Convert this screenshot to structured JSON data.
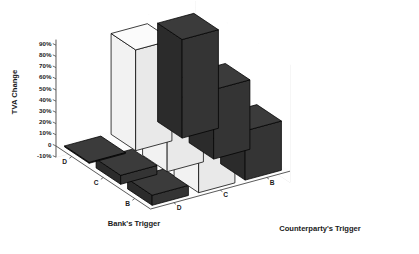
{
  "chart_data": {
    "type": "bar",
    "subtype": "3d-grouped-bar",
    "title": "",
    "ylabel": "TVA Change",
    "xlabel": "Bank's Trigger",
    "zlabel": "Counterparty's Trigger",
    "x_categories": [
      "D",
      "C",
      "B"
    ],
    "z_categories": [
      "D",
      "C",
      "B"
    ],
    "ytick_labels": [
      "90%",
      "80%",
      "70%",
      "60%",
      "50%",
      "40%",
      "30%",
      "20%",
      "10%",
      "0",
      "-10%"
    ],
    "ytick_values": [
      90,
      80,
      70,
      60,
      50,
      40,
      30,
      20,
      10,
      0,
      -10
    ],
    "ylim": [
      -10,
      95
    ],
    "grid": true,
    "grid_position": "back-walls",
    "legend": "none",
    "colors": {
      "white_bar": "#f7f7f7",
      "dark_bar": "#333333",
      "bar_edge": "#000000",
      "grid": "#d8d8d8",
      "axis": "#4a4a4a",
      "text": "#1a1a1a",
      "background": "#ffffff"
    },
    "note": "Diagonal cells (bank trigger equals counterparty trigger) are near-zero flat dark bars; off-diagonal cells are tall bars.",
    "cells": [
      {
        "x": "D",
        "z": "D",
        "value": 0,
        "color": "dark"
      },
      {
        "x": "D",
        "z": "C",
        "value": 90,
        "color": "white"
      },
      {
        "x": "D",
        "z": "B",
        "value": 88,
        "color": "dark"
      },
      {
        "x": "C",
        "z": "D",
        "value": 8,
        "color": "dark"
      },
      {
        "x": "C",
        "z": "C",
        "value": 63,
        "color": "white"
      },
      {
        "x": "C",
        "z": "B",
        "value": 62,
        "color": "dark"
      },
      {
        "x": "B",
        "z": "D",
        "value": 9,
        "color": "dark"
      },
      {
        "x": "B",
        "z": "C",
        "value": 45,
        "color": "white"
      },
      {
        "x": "B",
        "z": "B",
        "value": 44,
        "color": "dark"
      }
    ],
    "series": [
      {
        "name": "Counterparty's Trigger D",
        "categories": [
          "D",
          "C",
          "B"
        ],
        "values": [
          0,
          8,
          9
        ]
      },
      {
        "name": "Counterparty's Trigger C",
        "categories": [
          "D",
          "C",
          "B"
        ],
        "values": [
          90,
          63,
          45
        ]
      },
      {
        "name": "Counterparty's Trigger B",
        "categories": [
          "D",
          "C",
          "B"
        ],
        "values": [
          88,
          62,
          44
        ]
      }
    ]
  },
  "axes": {
    "y_title": "TVA Change",
    "x_title": "Bank's Trigger",
    "z_title": "Counterparty's Trigger",
    "y_ticks": [
      "90%",
      "80%",
      "70%",
      "60%",
      "50%",
      "40%",
      "30%",
      "20%",
      "10%",
      "0",
      "-10%"
    ],
    "x_ticks": [
      "D",
      "C",
      "B"
    ],
    "z_ticks": [
      "D",
      "C",
      "B"
    ]
  }
}
